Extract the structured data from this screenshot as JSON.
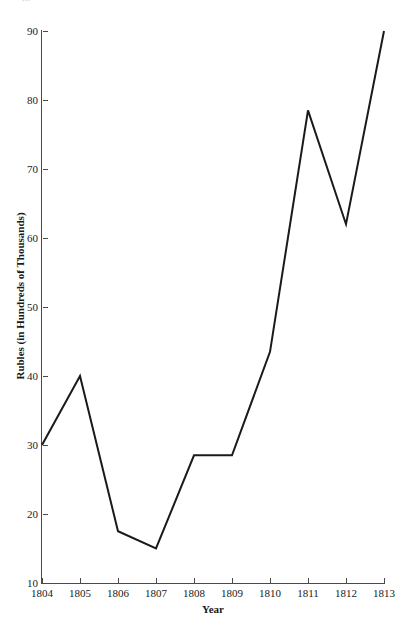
{
  "caption": {
    "cut_off_text": "..."
  },
  "chart_data": {
    "type": "line",
    "title": "",
    "xlabel": "Year",
    "ylabel": "Rubles (in Hundreds of Thousands)",
    "categories": [
      "1804",
      "1805",
      "1806",
      "1807",
      "1808",
      "1809",
      "1810",
      "1811",
      "1812",
      "1813"
    ],
    "x": [
      1804,
      1805,
      1806,
      1807,
      1808,
      1809,
      1810,
      1811,
      1812,
      1813
    ],
    "values": [
      30,
      40,
      17.5,
      15,
      28.5,
      28.5,
      43.5,
      78.5,
      62,
      90
    ],
    "series": [
      {
        "name": "Rubles",
        "values": [
          30,
          40,
          17.5,
          15,
          28.5,
          28.5,
          43.5,
          78.5,
          62,
          90
        ],
        "color": "#1a1a1a"
      }
    ],
    "ylim": [
      10,
      90
    ],
    "xlim": [
      1804,
      1813
    ],
    "yticks": [
      10,
      20,
      30,
      40,
      50,
      60,
      70,
      80,
      90
    ],
    "ytick_labels": [
      "10",
      "20",
      "30",
      "40",
      "50",
      "60",
      "70",
      "80",
      "90"
    ],
    "xticks": [
      1804,
      1805,
      1806,
      1807,
      1808,
      1809,
      1810,
      1811,
      1812,
      1813
    ],
    "xtick_labels": [
      "1804",
      "1805",
      "1806",
      "1807",
      "1808",
      "1809",
      "1810",
      "1811",
      "1812",
      "1813"
    ],
    "grid": false,
    "legend": false,
    "legend_position": "none",
    "line_width": 2,
    "markers": false,
    "axis_color": "#4a4a4a",
    "background_color": "#ffffff"
  }
}
